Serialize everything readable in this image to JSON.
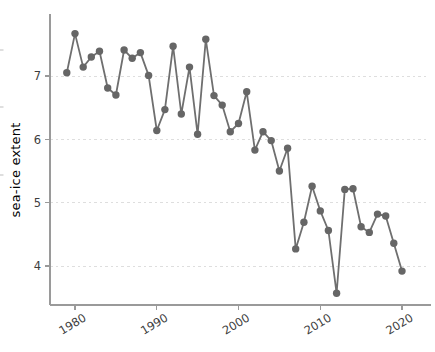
{
  "figure": {
    "background": "#ffffff"
  },
  "chart_data": {
    "type": "line",
    "title": "",
    "xlabel": "",
    "ylabel": "sea-ice extent",
    "x": [
      1979,
      1980,
      1981,
      1982,
      1983,
      1984,
      1985,
      1986,
      1987,
      1988,
      1989,
      1990,
      1991,
      1992,
      1993,
      1994,
      1995,
      1996,
      1997,
      1998,
      1999,
      2000,
      2001,
      2002,
      2003,
      2004,
      2005,
      2006,
      2007,
      2008,
      2009,
      2010,
      2011,
      2012,
      2013,
      2014,
      2015,
      2016,
      2017,
      2018,
      2019,
      2020
    ],
    "values": [
      7.05,
      7.67,
      7.14,
      7.3,
      7.39,
      6.81,
      6.7,
      7.41,
      7.28,
      7.37,
      7.01,
      6.14,
      6.47,
      7.47,
      6.4,
      7.14,
      6.08,
      7.58,
      6.69,
      6.54,
      6.12,
      6.25,
      6.75,
      5.83,
      6.12,
      5.98,
      5.5,
      5.86,
      4.27,
      4.69,
      5.26,
      4.87,
      4.56,
      3.57,
      5.21,
      5.22,
      4.62,
      4.53,
      4.82,
      4.79,
      4.36,
      3.92
    ],
    "x_ticks": [
      "1980",
      "1990",
      "2000",
      "2010",
      "2020"
    ],
    "x_tick_years": [
      1980,
      1990,
      2000,
      2010,
      2020
    ],
    "y_ticks": [
      "4",
      "5",
      "6",
      "7"
    ],
    "y_tick_values": [
      4,
      5,
      6,
      7
    ],
    "xlim": [
      1976.9,
      2023.4
    ],
    "ylim": [
      3.38,
      7.98
    ],
    "grid": "horizontal-dashed",
    "legend": "none",
    "marker": "filled-circle",
    "colors": {
      "series_line": "#6f6f6f",
      "marker_fill": "#666666",
      "axis": "#9a9a9a",
      "grid": "#dedede",
      "text": "#3d3d3d",
      "edge_artifact": "#c9c9c9"
    }
  }
}
